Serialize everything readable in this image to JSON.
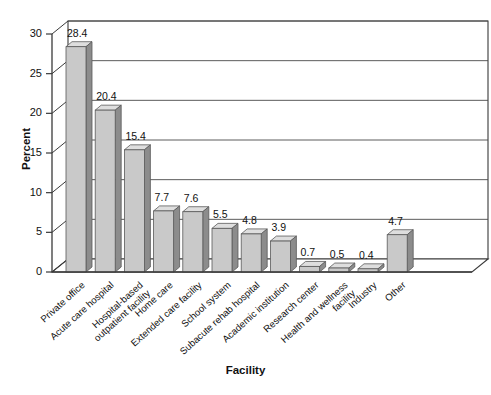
{
  "chart_data": {
    "type": "bar",
    "title": "",
    "xlabel": "Facility",
    "ylabel": "Percent",
    "categories": [
      "Private office",
      "Acute care hospital",
      "Hospital-based\noutpatient facility",
      "Home care",
      "Extended care facility",
      "School system",
      "Subacute rehab hospital",
      "Academic institution",
      "Research center",
      "Health and wellness\nfacility",
      "Industry",
      "Other"
    ],
    "values": [
      28.4,
      20.4,
      15.4,
      7.7,
      7.6,
      5.5,
      4.8,
      3.9,
      0.7,
      0.5,
      0.4,
      4.7
    ],
    "value_labels": [
      "28.4",
      "20.4",
      "15.4",
      "7.7",
      "7.6",
      "5.5",
      "4.8",
      "3.9",
      "0.7",
      "0.5",
      "0.4",
      "4.7"
    ],
    "ylim": [
      0,
      30
    ],
    "yticks": [
      0,
      5,
      10,
      15,
      20,
      25,
      30
    ],
    "ytick_labels": [
      "0",
      "5",
      "10",
      "15",
      "20",
      "25",
      "30"
    ],
    "grid": true,
    "legend": "none",
    "style": "3d-bar",
    "colors": {
      "bar_front": "#c9c9c9",
      "bar_side": "#8c8c8c",
      "bar_top": "#dedede",
      "axis": "#3a3a3a",
      "grid": "#4a4a4a",
      "background": "#ffffff",
      "wall": "#ffffff",
      "floor": "#ffffff"
    }
  }
}
